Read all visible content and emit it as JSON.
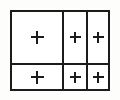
{
  "diagram": {
    "type": "table-grid",
    "background_color": "#fdfdfc",
    "line_color": "#1b1b1b",
    "cell_fill_color": "#ffffff",
    "border_width_px": 2,
    "frame": {
      "x": 10,
      "y": 10,
      "width": 100,
      "height": 81
    },
    "rows": 2,
    "columns": 3,
    "column_dividers_x": [
      62,
      86
    ],
    "row_dividers_y": [
      63
    ],
    "mark_glyph": "+",
    "cells": [
      {
        "id": "cell-r1c1",
        "row": 1,
        "column": 1,
        "mark": "+",
        "x": 12,
        "y": 12,
        "width": 50,
        "height": 51
      },
      {
        "id": "cell-r1c2",
        "row": 1,
        "column": 2,
        "mark": "+",
        "x": 64,
        "y": 12,
        "width": 22,
        "height": 51
      },
      {
        "id": "cell-r1c3",
        "row": 1,
        "column": 3,
        "mark": "+",
        "x": 88,
        "y": 12,
        "width": 20,
        "height": 51
      },
      {
        "id": "cell-r2c1",
        "row": 2,
        "column": 1,
        "mark": "+",
        "x": 12,
        "y": 65,
        "width": 50,
        "height": 24
      },
      {
        "id": "cell-r2c2",
        "row": 2,
        "column": 2,
        "mark": "+",
        "x": 64,
        "y": 65,
        "width": 22,
        "height": 24
      },
      {
        "id": "cell-r2c3",
        "row": 2,
        "column": 3,
        "mark": "+",
        "x": 88,
        "y": 65,
        "width": 20,
        "height": 24
      }
    ]
  }
}
